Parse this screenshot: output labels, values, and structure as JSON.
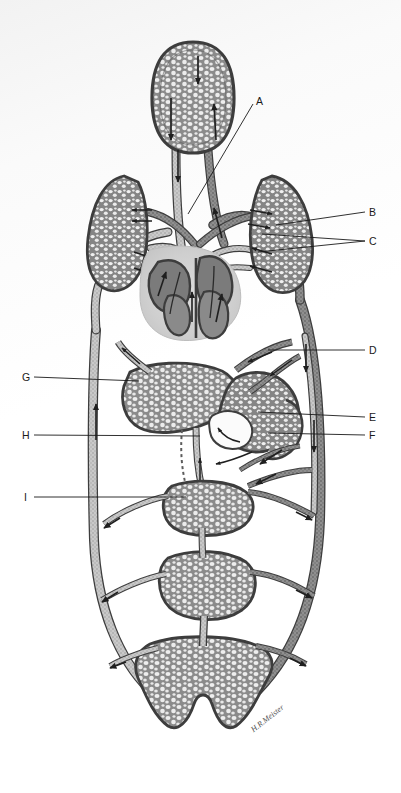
{
  "figure": {
    "style": "grayscale stipple anatomical illustration",
    "background_color": "#fdfdfd",
    "signature": "H.R.Meister",
    "signature_position": {
      "x": 252,
      "y": 726
    },
    "ink_color": "#3d3d3d",
    "vessel_dark": "#6e6e6e",
    "vessel_light": "#a9a9a9",
    "capillary_fill": "#8d8d8d",
    "capillary_lumen": "#efefef"
  },
  "labels": [
    {
      "id": "A",
      "text": "A",
      "x": 256,
      "y": 96,
      "leader": {
        "x1": 253,
        "y1": 104,
        "x2": 188,
        "y2": 214
      }
    },
    {
      "id": "B",
      "text": "B",
      "x": 369,
      "y": 207,
      "leader": {
        "x1": 365,
        "y1": 212,
        "x2": 276,
        "y2": 225
      }
    },
    {
      "id": "C",
      "text": "C",
      "x": 369,
      "y": 236,
      "leader": {
        "x1": 365,
        "y1": 241,
        "x2": 262,
        "y2": 234
      }
    },
    {
      "id": "C2",
      "text": "",
      "x": 0,
      "y": 0,
      "leader": {
        "x1": 365,
        "y1": 241,
        "x2": 258,
        "y2": 251
      }
    },
    {
      "id": "D",
      "text": "D",
      "x": 369,
      "y": 345,
      "leader": {
        "x1": 365,
        "y1": 350,
        "x2": 268,
        "y2": 350
      }
    },
    {
      "id": "E",
      "text": "E",
      "x": 369,
      "y": 412,
      "leader": {
        "x1": 365,
        "y1": 417,
        "x2": 258,
        "y2": 412
      }
    },
    {
      "id": "F",
      "text": "F",
      "x": 369,
      "y": 430,
      "leader": {
        "x1": 365,
        "y1": 435,
        "x2": 268,
        "y2": 432
      }
    },
    {
      "id": "G",
      "text": "G",
      "x": 22,
      "y": 372,
      "leader": {
        "x1": 34,
        "y1": 377,
        "x2": 139,
        "y2": 381
      }
    },
    {
      "id": "H",
      "text": "H",
      "x": 22,
      "y": 430,
      "leader": {
        "x1": 34,
        "y1": 435,
        "x2": 200,
        "y2": 436
      }
    },
    {
      "id": "I",
      "text": "I",
      "x": 24,
      "y": 492,
      "leader": {
        "x1": 34,
        "y1": 497,
        "x2": 186,
        "y2": 497
      }
    }
  ],
  "organs": [
    {
      "name": "head-capillary-bed",
      "label_ref": "",
      "cx": 193,
      "cy": 97,
      "rx": 40,
      "ry": 55
    },
    {
      "name": "left-lung",
      "label_ref": "",
      "cx": 117,
      "cy": 230,
      "rx": 32,
      "ry": 55
    },
    {
      "name": "right-lung",
      "label_ref": "B",
      "cx": 281,
      "cy": 230,
      "rx": 33,
      "ry": 56
    },
    {
      "name": "heart",
      "label_ref": "",
      "cx": 190,
      "cy": 287,
      "rx": 48,
      "ry": 44
    },
    {
      "name": "liver",
      "label_ref": "G",
      "cx": 172,
      "cy": 400,
      "rx": 48,
      "ry": 34
    },
    {
      "name": "stomach-intestine",
      "label_ref": "E",
      "cx": 262,
      "cy": 412,
      "rx": 45,
      "ry": 36
    },
    {
      "name": "upper-gut-capillary-bed",
      "label_ref": "I",
      "cx": 205,
      "cy": 505,
      "rx": 42,
      "ry": 28
    },
    {
      "name": "mid-gut-capillary-bed",
      "label_ref": "",
      "cx": 205,
      "cy": 585,
      "rx": 42,
      "ry": 32
    },
    {
      "name": "lower-body-capillary-bed",
      "label_ref": "",
      "cx": 203,
      "cy": 672,
      "rx": 62,
      "ry": 42
    }
  ],
  "vessels": {
    "names": [
      "anterior-vena-cava",
      "carotid-artery",
      "pulmonary-artery",
      "pulmonary-vein",
      "aorta",
      "posterior-vena-cava",
      "hepatic-portal-vein",
      "hepatic-vein",
      "mesenteric-artery",
      "renal-vessels"
    ],
    "flow_arrow_count": 26
  }
}
